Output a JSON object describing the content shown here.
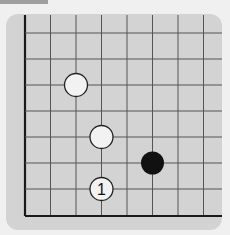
{
  "diagram": {
    "type": "go-board-corner",
    "grid": {
      "x_lines": [
        25,
        50.5,
        76,
        101.5,
        127,
        152.5,
        178,
        203.5
      ],
      "y_lines": [
        33,
        59,
        85,
        111,
        137,
        163,
        189,
        216
      ],
      "edges": [
        "left",
        "bottom"
      ]
    },
    "colors": {
      "board": "#d3d3d3",
      "line": "#555555",
      "edge": "#1a1a1a",
      "black": "#111111",
      "white": "#f2f2f2"
    },
    "stones": [
      {
        "color": "white",
        "col": 2,
        "row": 2,
        "label": ""
      },
      {
        "color": "white",
        "col": 3,
        "row": 4,
        "label": ""
      },
      {
        "color": "white",
        "col": 3,
        "row": 6,
        "label": "1"
      },
      {
        "color": "black",
        "col": 5,
        "row": 5,
        "label": ""
      }
    ]
  }
}
